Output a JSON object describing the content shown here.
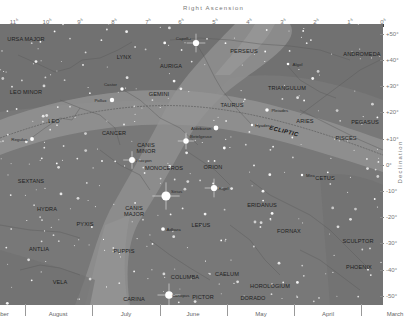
{
  "chart_data": {
    "type": "star-map",
    "title": "",
    "xlabel": "Right Ascension",
    "ylabel": "Declination",
    "x_ticks": [
      "11h",
      "10h",
      "9h",
      "8h",
      "7h",
      "6h",
      "5h",
      "4h",
      "3h",
      "2h",
      "1h",
      "0h"
    ],
    "y_ticks": [
      "+50°",
      "+40°",
      "+30°",
      "+20°",
      "+10°",
      "0°",
      "-10°",
      "-20°",
      "-30°",
      "-40°",
      "-50°"
    ],
    "months": [
      "mber",
      "August",
      "July",
      "June",
      "May",
      "April",
      "March"
    ],
    "grid": false,
    "ecliptic_label": "ECLIPTIC",
    "constellations": [
      {
        "name": "URSA MAJOR",
        "x": 26,
        "y": 39
      },
      {
        "name": "LYNX",
        "x": 124,
        "y": 57
      },
      {
        "name": "AURIGA",
        "x": 171,
        "y": 66
      },
      {
        "name": "PERSEUS",
        "x": 244,
        "y": 51
      },
      {
        "name": "ANDROMEDA",
        "x": 362,
        "y": 54
      },
      {
        "name": "LEO MINOR",
        "x": 26,
        "y": 92
      },
      {
        "name": "GEMINI",
        "x": 159,
        "y": 94
      },
      {
        "name": "TRIANGULUM",
        "x": 287,
        "y": 88
      },
      {
        "name": "TAURUS",
        "x": 232,
        "y": 105
      },
      {
        "name": "LEO",
        "x": 54,
        "y": 121
      },
      {
        "name": "ARIES",
        "x": 305,
        "y": 121
      },
      {
        "name": "PEGASUS",
        "x": 365,
        "y": 122
      },
      {
        "name": "CANCER",
        "x": 114,
        "y": 133
      },
      {
        "name": "PISCES",
        "x": 346,
        "y": 138
      },
      {
        "name": "CANIS MINOR",
        "x": 146,
        "y": 148
      },
      {
        "name": "MONOCEROS",
        "x": 164,
        "y": 168
      },
      {
        "name": "ORION",
        "x": 213,
        "y": 167
      },
      {
        "name": "CETUS",
        "x": 325,
        "y": 178
      },
      {
        "name": "SEXTANS",
        "x": 31,
        "y": 181
      },
      {
        "name": "ERIDANUS",
        "x": 262,
        "y": 205
      },
      {
        "name": "CANIS MAJOR",
        "x": 134,
        "y": 211
      },
      {
        "name": "HYDRA",
        "x": 47,
        "y": 209
      },
      {
        "name": "LEPUS",
        "x": 201,
        "y": 225
      },
      {
        "name": "PYXIS",
        "x": 85,
        "y": 224
      },
      {
        "name": "FORNAX",
        "x": 289,
        "y": 231
      },
      {
        "name": "SCULPTOR",
        "x": 358,
        "y": 241
      },
      {
        "name": "ANTLIA",
        "x": 39,
        "y": 249
      },
      {
        "name": "PUPPIS",
        "x": 124,
        "y": 251
      },
      {
        "name": "PHOENIX",
        "x": 359,
        "y": 267
      },
      {
        "name": "COLUMBA",
        "x": 185,
        "y": 277
      },
      {
        "name": "CAELUM",
        "x": 227,
        "y": 274
      },
      {
        "name": "VELA",
        "x": 60,
        "y": 282
      },
      {
        "name": "HOROLOGIUM",
        "x": 270,
        "y": 286
      },
      {
        "name": "CARINA",
        "x": 134,
        "y": 299
      },
      {
        "name": "PICTOR",
        "x": 203,
        "y": 297
      },
      {
        "name": "DORADO",
        "x": 253,
        "y": 298
      }
    ],
    "named_stars": [
      {
        "name": "Capella",
        "x": 196,
        "y": 43,
        "mag": 0.1
      },
      {
        "name": "Algol",
        "x": 288,
        "y": 64,
        "mag": 2.1
      },
      {
        "name": "Castor",
        "x": 122,
        "y": 89,
        "mag": 1.6
      },
      {
        "name": "Pollux",
        "x": 112,
        "y": 100,
        "mag": 1.1
      },
      {
        "name": "Pleiades",
        "x": 267,
        "y": 110,
        "mag": 1.6
      },
      {
        "name": "Aldebaran",
        "x": 216,
        "y": 128,
        "mag": 0.9
      },
      {
        "name": "Hyades",
        "x": 252,
        "y": 125,
        "mag": 3.4
      },
      {
        "name": "Regulus",
        "x": 32,
        "y": 139,
        "mag": 1.4
      },
      {
        "name": "Betelgeuse",
        "x": 186,
        "y": 141,
        "mag": 0.5
      },
      {
        "name": "Procyon",
        "x": 132,
        "y": 160,
        "mag": 0.3
      },
      {
        "name": "Mira",
        "x": 302,
        "y": 175,
        "mag": 3.0
      },
      {
        "name": "Rigel",
        "x": 214,
        "y": 188,
        "mag": 0.1
      },
      {
        "name": "Sirius",
        "x": 166,
        "y": 196,
        "mag": -1.5
      },
      {
        "name": "Adhara",
        "x": 163,
        "y": 229,
        "mag": 1.5
      },
      {
        "name": "Canopus",
        "x": 169,
        "y": 295,
        "mag": -0.7
      }
    ]
  },
  "axes": {
    "top_title": "Right Ascension",
    "right_title": "Declination",
    "ra_ticks": [
      {
        "label": "11h",
        "x": 14
      },
      {
        "label": "10h",
        "x": 47
      },
      {
        "label": "9h",
        "x": 80
      },
      {
        "label": "8h",
        "x": 114
      },
      {
        "label": "7h",
        "x": 148
      },
      {
        "label": "6h",
        "x": 181
      },
      {
        "label": "5h",
        "x": 215
      },
      {
        "label": "4h",
        "x": 249
      },
      {
        "label": "3h",
        "x": 283
      },
      {
        "label": "2h",
        "x": 316
      },
      {
        "label": "1h",
        "x": 350
      },
      {
        "label": "0h",
        "x": 383
      }
    ],
    "dec_ticks": [
      {
        "label": "+50°",
        "y": 34
      },
      {
        "label": "+40°",
        "y": 60
      },
      {
        "label": "+30°",
        "y": 86
      },
      {
        "label": "+20°",
        "y": 112
      },
      {
        "label": "+10°",
        "y": 139
      },
      {
        "label": "0°",
        "y": 165
      },
      {
        "label": "-10°",
        "y": 191
      },
      {
        "label": "-20°",
        "y": 217
      },
      {
        "label": "-30°",
        "y": 243
      },
      {
        "label": "-40°",
        "y": 270
      },
      {
        "label": "-50°",
        "y": 296
      }
    ],
    "months": [
      {
        "label": "mber",
        "x": 2
      },
      {
        "label": "August",
        "x": 58
      },
      {
        "label": "July",
        "x": 126
      },
      {
        "label": "June",
        "x": 193
      },
      {
        "label": "May",
        "x": 261
      },
      {
        "label": "April",
        "x": 328
      },
      {
        "label": "March",
        "x": 395
      }
    ],
    "month_separators": [
      25,
      92,
      160,
      227,
      294,
      361
    ]
  },
  "colors": {
    "sky": "#787878",
    "milky_way": "#8f8f8f",
    "ecliptic_band": "#959595",
    "dark_region": "#6b6b6b",
    "star": "#ffffff",
    "lines": "#5e5e5e"
  }
}
